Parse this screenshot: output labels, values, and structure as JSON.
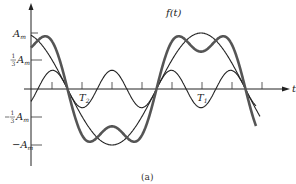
{
  "figure": {
    "caption": "(a)",
    "curve_label": "f(t)",
    "time_axis_label": "t",
    "y_tick_labels": {
      "pos_full": "A",
      "pos_full_sub": "m",
      "pos_third_frac": "1/3",
      "pos_third": "A",
      "pos_third_sub": "m",
      "neg_third_frac": "-1/3",
      "neg_third": "A",
      "neg_third_sub": "m",
      "neg_full": "−A",
      "neg_full_sub": "m"
    },
    "period_labels": {
      "t2": "T",
      "t2_sub": "2",
      "t1": "T",
      "t1_sub": "1"
    }
  },
  "chart_data": {
    "type": "line",
    "xlabel": "t",
    "ylabel": "",
    "y_ticks": [
      "A_m",
      "1/3 A_m",
      "-1/3 A_m",
      "-A_m"
    ],
    "series": [
      {
        "name": "fundamental",
        "expression": "A_m cos(wt)",
        "amplitude": 1.0,
        "harmonic": 1,
        "style": "thin"
      },
      {
        "name": "third harmonic",
        "expression": "-(1/3) A_m cos(3wt)",
        "amplitude": 0.3333,
        "harmonic": 3,
        "style": "thin"
      },
      {
        "name": "f(t)",
        "expression": "A_m cos(wt) - (1/3) A_m cos(3wt)",
        "style": "thick"
      }
    ],
    "annotations": [
      "T_1 (period of fundamental)",
      "T_2 (period of third harmonic)"
    ]
  },
  "geometry": {
    "origin_x": 31,
    "axis_y": 89,
    "amp_px": 56,
    "phase_x": 23,
    "period_px": 178,
    "x_start": 31,
    "x_end": 256,
    "tick_xs": [
      52,
      82,
      112,
      142,
      172,
      202,
      232,
      262
    ]
  }
}
